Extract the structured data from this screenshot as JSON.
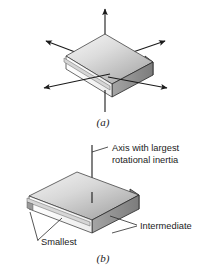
{
  "figure": {
    "background_color": "#ffffff",
    "panels": [
      {
        "id": "a",
        "caption": "(a)",
        "description": "Block with three double-headed principal rotation axes shown as arrows",
        "axes": [
          {
            "name": "vertical-axis",
            "arrow_heads": "both",
            "orientation": "vertical"
          },
          {
            "name": "long-horizontal-axis",
            "arrow_heads": "both",
            "orientation": "diagonal-left-down-right-up"
          },
          {
            "name": "short-horizontal-axis",
            "arrow_heads": "both",
            "orientation": "diagonal-left-up-right-down"
          }
        ]
      },
      {
        "id": "b",
        "caption": "(b)",
        "description": "Same block with the three axes labelled by relative rotational inertia",
        "labels": [
          {
            "name": "largest-axis-label",
            "text_line1": "Axis with largest",
            "text_line2": "rotational inertia"
          },
          {
            "name": "intermediate-axis-label",
            "text": "Intermediate"
          },
          {
            "name": "smallest-axis-label",
            "text": "Smallest"
          }
        ]
      }
    ]
  },
  "colors": {
    "top_face_light": "#f2f2f2",
    "top_face_mid": "#c9c9c9",
    "top_face_dark": "#9d9d9d",
    "front_face": "#8f8f8f",
    "right_face": "#7a7a7a",
    "thin_edge_white": "#fbfbfb",
    "outline": "#3a3a3a",
    "arrow_black": "#1a1a1a",
    "text": "#1b1b1b"
  }
}
